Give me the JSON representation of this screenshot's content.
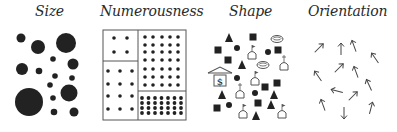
{
  "panels": [
    {
      "id": "size",
      "title": "Size"
    },
    {
      "id": "numerousness",
      "title": "Numerousness"
    },
    {
      "id": "shape",
      "title": "Shape"
    },
    {
      "id": "orientation",
      "title": "Orientation"
    }
  ],
  "colors": {
    "ink": "#222222",
    "line": "#555555",
    "background": "#ffffff"
  },
  "size_circles": [
    {
      "x": 21,
      "y": 38,
      "r": 4.5
    },
    {
      "x": 38,
      "y": 47,
      "r": 7
    },
    {
      "x": 66,
      "y": 43,
      "r": 10
    },
    {
      "x": 53,
      "y": 59,
      "r": 2.8
    },
    {
      "x": 73,
      "y": 64,
      "r": 5.5
    },
    {
      "x": 22,
      "y": 69,
      "r": 6
    },
    {
      "x": 39,
      "y": 71,
      "r": 3.3
    },
    {
      "x": 55,
      "y": 76,
      "r": 2.8
    },
    {
      "x": 72,
      "y": 78,
      "r": 2.8
    },
    {
      "x": 50,
      "y": 85,
      "r": 2.8
    },
    {
      "x": 29,
      "y": 102,
      "r": 14
    },
    {
      "x": 69,
      "y": 93,
      "r": 8.5
    },
    {
      "x": 53,
      "y": 98,
      "r": 2.8
    },
    {
      "x": 54,
      "y": 112,
      "r": 3.3
    },
    {
      "x": 74,
      "y": 112,
      "r": 4.5
    }
  ],
  "numerousness": {
    "box": {
      "x": 103,
      "y": 30,
      "w": 83,
      "h": 90
    },
    "v_divider_x": 138,
    "left_divider_y": 61,
    "right_divider_y": 91,
    "cells": [
      {
        "name": "top-left",
        "cols": [
          114,
          127
        ],
        "rows": [
          38,
          52
        ],
        "r": 1.8
      },
      {
        "name": "bottom-left",
        "cols": [
          108,
          120,
          132
        ],
        "rows": [
          71,
          84,
          96,
          109
        ],
        "r": 1.8
      },
      {
        "name": "top-right",
        "cols": [
          145,
          153,
          162,
          170,
          178
        ],
        "rows": [
          37,
          45,
          52,
          60,
          69,
          77,
          85
        ],
        "r": 1.8
      },
      {
        "name": "bottom-right",
        "cols": [
          142,
          148.5,
          155,
          161.5,
          168,
          174.5,
          181
        ],
        "rows": [
          98,
          103,
          108,
          113
        ],
        "r": 1.9
      }
    ]
  },
  "shapes": [
    {
      "type": "triangle",
      "x": 229,
      "y": 38
    },
    {
      "type": "square",
      "x": 253,
      "y": 37
    },
    {
      "type": "bowl",
      "x": 277,
      "y": 39
    },
    {
      "type": "square",
      "x": 218,
      "y": 50
    },
    {
      "type": "circle",
      "x": 237,
      "y": 48
    },
    {
      "type": "tomb-flag",
      "x": 252,
      "y": 54
    },
    {
      "type": "circle",
      "x": 268,
      "y": 52
    },
    {
      "type": "square",
      "x": 278,
      "y": 50
    },
    {
      "type": "square",
      "x": 228,
      "y": 60
    },
    {
      "type": "triangle",
      "x": 242,
      "y": 65
    },
    {
      "type": "bowl",
      "x": 263,
      "y": 65
    },
    {
      "type": "tomb-cross",
      "x": 284,
      "y": 65
    },
    {
      "type": "bank",
      "x": 220,
      "y": 78
    },
    {
      "type": "circle",
      "x": 237,
      "y": 78
    },
    {
      "type": "tomb-flag",
      "x": 255,
      "y": 80
    },
    {
      "type": "square",
      "x": 265,
      "y": 87
    },
    {
      "type": "square",
      "x": 277,
      "y": 83
    },
    {
      "type": "triangle",
      "x": 222,
      "y": 95
    },
    {
      "type": "tomb-cross",
      "x": 240,
      "y": 93
    },
    {
      "type": "circle",
      "x": 255,
      "y": 93
    },
    {
      "type": "triangle",
      "x": 274,
      "y": 95
    },
    {
      "type": "square",
      "x": 217,
      "y": 108
    },
    {
      "type": "circle",
      "x": 229,
      "y": 105
    },
    {
      "type": "square",
      "x": 258,
      "y": 103
    },
    {
      "type": "triangle",
      "x": 271,
      "y": 105
    },
    {
      "type": "tomb-flag",
      "x": 243,
      "y": 113
    },
    {
      "type": "triangle",
      "x": 256,
      "y": 116
    },
    {
      "type": "tomb-flag",
      "x": 282,
      "y": 113
    }
  ],
  "bank_label": "$",
  "arrows": [
    {
      "x": 319,
      "y": 48,
      "angle": 45
    },
    {
      "x": 341,
      "y": 49,
      "angle": 0
    },
    {
      "x": 354,
      "y": 46,
      "angle": -20
    },
    {
      "x": 375,
      "y": 58,
      "angle": -35
    },
    {
      "x": 318,
      "y": 76,
      "angle": -35
    },
    {
      "x": 339,
      "y": 68,
      "angle": 45
    },
    {
      "x": 356,
      "y": 72,
      "angle": -20
    },
    {
      "x": 369,
      "y": 85,
      "angle": -25
    },
    {
      "x": 337,
      "y": 91,
      "angle": -75
    },
    {
      "x": 353,
      "y": 96,
      "angle": 45
    },
    {
      "x": 323,
      "y": 105,
      "angle": -20
    },
    {
      "x": 344,
      "y": 113,
      "angle": 180
    },
    {
      "x": 371,
      "y": 108,
      "angle": 15
    }
  ]
}
